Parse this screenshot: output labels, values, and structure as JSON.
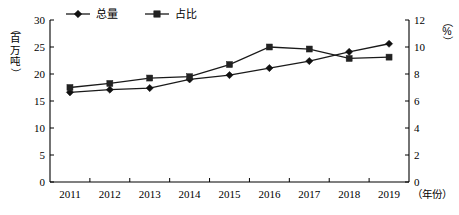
{
  "chart_data": {
    "type": "line",
    "title": "",
    "xlabel": "（年份）",
    "ylabel": "（百万吨）",
    "y2label": "（%）",
    "categories": [
      "2011",
      "2012",
      "2013",
      "2014",
      "2015",
      "2016",
      "2017",
      "2018",
      "2019"
    ],
    "grid": false,
    "legend_position": "top-center",
    "ylim": [
      0,
      30
    ],
    "yticks": [
      "0",
      "5",
      "10",
      "15",
      "20",
      "25",
      "30"
    ],
    "y2lim": [
      0,
      12
    ],
    "y2ticks": [
      "0",
      "2",
      "4",
      "6",
      "8",
      "10",
      "12"
    ],
    "series": [
      {
        "name": "总量",
        "axis": "left",
        "marker": "diamond",
        "values": [
          16.6,
          17.1,
          17.4,
          19.0,
          19.8,
          21.1,
          22.4,
          24.1,
          25.6
        ]
      },
      {
        "name": "占比",
        "axis": "right",
        "marker": "square",
        "values": [
          7.0,
          7.3,
          7.7,
          7.8,
          8.7,
          10.0,
          9.85,
          9.15,
          9.25
        ]
      }
    ]
  },
  "legend": {
    "items": [
      {
        "label": "总量",
        "marker": "diamond"
      },
      {
        "label": "占比",
        "marker": "square"
      }
    ]
  },
  "axes": {
    "left_title_chars": [
      "（",
      "百",
      "万",
      "吨",
      "）"
    ],
    "right_title_chars": [
      "（",
      "%",
      "）"
    ],
    "x_axis_unit_label": "（年份）"
  },
  "colors": {
    "series_total": "#111111",
    "series_share": "#222222",
    "axis": "#000000",
    "background": "#ffffff"
  }
}
